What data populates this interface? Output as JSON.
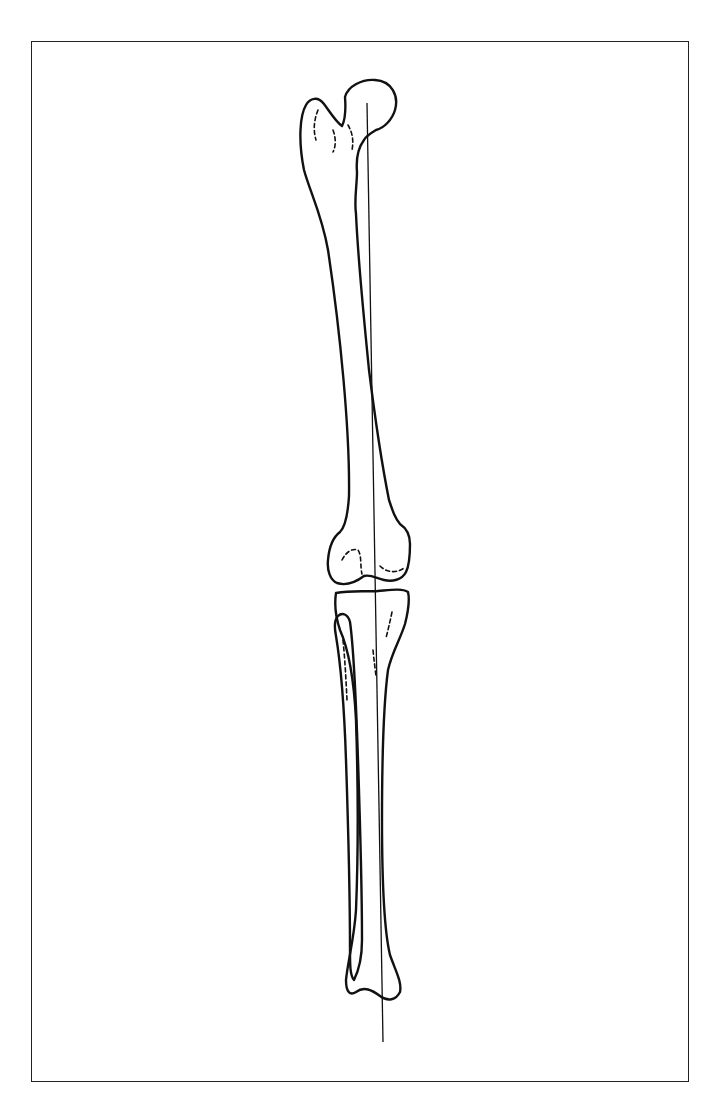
{
  "figure": {
    "elements": [
      "femur",
      "patella region / knee joint",
      "tibia",
      "fibula",
      "mechanical axis line"
    ],
    "colors": {
      "line": "#111111",
      "background": "#ffffff",
      "frame": "#222222"
    }
  }
}
